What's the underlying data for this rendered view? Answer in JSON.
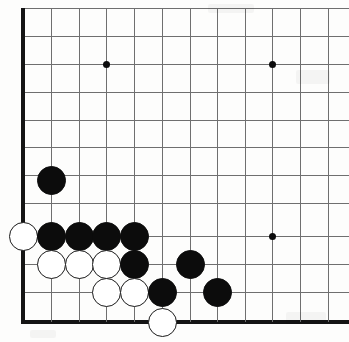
{
  "figure": {
    "kind": "go-board-diagram",
    "width": 349,
    "height": 342,
    "background_color": "#fdfdfc",
    "line_color": "#6f6f6f",
    "edge_color": "#141414",
    "black_stone_color": "#0c0c0c",
    "white_stone_color": "#ffffff",
    "white_stone_border_color": "#1a1a1a"
  },
  "board": {
    "orientation": "bottom-left-corner",
    "grid_pitch": 27.8,
    "stone_diameter": 29,
    "column_x": [
      23,
      51,
      79,
      106,
      134,
      162,
      190,
      217,
      245,
      272,
      300,
      328
    ],
    "row_y": [
      8,
      36,
      64,
      92,
      120,
      147,
      175,
      203,
      236,
      264,
      292,
      322
    ],
    "left_edge_x": 23,
    "bottom_edge_y": 322,
    "left_edge_is_board_border": true,
    "bottom_edge_is_board_border": true,
    "top_cut_off": true,
    "right_cut_off": true
  },
  "star_points": [
    {
      "name": "star-top-left",
      "x": 106,
      "y": 64
    },
    {
      "name": "star-top-right",
      "x": 272,
      "y": 64
    },
    {
      "name": "star-bottom-right",
      "x": 272,
      "y": 236
    }
  ],
  "stones": [
    {
      "name": "black-stone-1",
      "color": "black",
      "x": 51,
      "y": 180
    },
    {
      "name": "white-stone-1",
      "color": "white",
      "x": 23,
      "y": 236
    },
    {
      "name": "black-stone-2",
      "color": "black",
      "x": 51,
      "y": 236
    },
    {
      "name": "black-stone-3",
      "color": "black",
      "x": 79,
      "y": 236
    },
    {
      "name": "black-stone-4",
      "color": "black",
      "x": 106,
      "y": 236
    },
    {
      "name": "black-stone-5",
      "color": "black",
      "x": 134,
      "y": 236
    },
    {
      "name": "white-stone-2",
      "color": "white",
      "x": 51,
      "y": 264
    },
    {
      "name": "white-stone-3",
      "color": "white",
      "x": 79,
      "y": 264
    },
    {
      "name": "white-stone-4",
      "color": "white",
      "x": 106,
      "y": 264
    },
    {
      "name": "black-stone-6",
      "color": "black",
      "x": 134,
      "y": 264
    },
    {
      "name": "black-stone-7",
      "color": "black",
      "x": 190,
      "y": 264
    },
    {
      "name": "white-stone-5",
      "color": "white",
      "x": 106,
      "y": 292
    },
    {
      "name": "white-stone-6",
      "color": "white",
      "x": 134,
      "y": 292
    },
    {
      "name": "black-stone-8",
      "color": "black",
      "x": 162,
      "y": 292
    },
    {
      "name": "black-stone-9",
      "color": "black",
      "x": 217,
      "y": 292
    },
    {
      "name": "white-stone-7",
      "color": "white",
      "x": 162,
      "y": 322
    }
  ],
  "specks": [
    {
      "x": 208,
      "y": 4,
      "w": 46,
      "h": 9
    },
    {
      "x": 296,
      "y": 70,
      "w": 34,
      "h": 14
    },
    {
      "x": 286,
      "y": 312,
      "w": 40,
      "h": 12
    },
    {
      "x": 30,
      "y": 330,
      "w": 26,
      "h": 8
    }
  ]
}
